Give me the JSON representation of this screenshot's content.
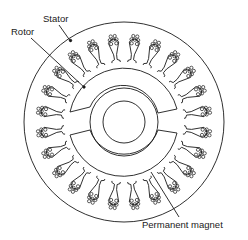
{
  "figure": {
    "type": "cross-section",
    "labels": {
      "stator": "Stator",
      "rotor": "Rotor",
      "magnet": "Permanent magnet"
    }
  },
  "geometry": {
    "center": [
      124,
      122
    ],
    "stator_outer_radius": 100,
    "slot_count": 24,
    "slot_inner_radius": 60,
    "slot_outer_radius": 92,
    "magnet_outer_radius": 55,
    "magnet_inner_radius": 43,
    "shaft_outer_radius": 29,
    "shaft_inner_radius": 18
  },
  "colors": {
    "line": "#1a1a1a",
    "background": "#ffffff"
  }
}
